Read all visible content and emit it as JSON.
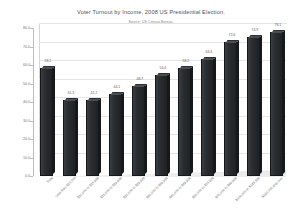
{
  "chart_data": {
    "type": "bar",
    "title": "Voter Turnout by Income, 2008 US Presidential Election.",
    "subtitle": "Source: US Census Bureau.",
    "xlabel": "",
    "ylabel": "",
    "ylim": [
      0.0,
      80.0
    ],
    "grid": true,
    "legend": "none",
    "yticks": [
      "0.0",
      "10.0",
      "20.0",
      "30.0",
      "40.0",
      "50.0",
      "60.0",
      "70.0",
      "80.0"
    ],
    "ytick_values": [
      0.0,
      10.0,
      20.0,
      30.0,
      40.0,
      50.0,
      60.0,
      70.0,
      80.0
    ],
    "categories": [
      "Total",
      "Less than $10,000",
      "$10,000 to $14,999",
      "$15,000 to $19,999",
      "$20,000 to $29,999",
      "$30,000 to $39,999",
      "$40,000 to $49,999",
      "$50,000 to $74,999",
      "$75,000 to $99,999",
      "$100,000 to $149,999",
      "$150,000 and over"
    ],
    "values": [
      58.2,
      41.3,
      41.2,
      44.1,
      48.7,
      54.4,
      58.2,
      63.4,
      72.6,
      74.9,
      78.1
    ],
    "value_labels": [
      "58.2",
      "41.3",
      "41.2",
      "44.1",
      "48.7",
      "54.4",
      "58.2",
      "63.4",
      "72.6",
      "74.9",
      "78.1"
    ],
    "bar_color": "#262A2D",
    "bar_top_color": "#4A4E52",
    "bar_side_color": "#16181A",
    "grid_color": "#E3E6E8",
    "axis_color": "#B9BDC1",
    "text_color": "#6D7276",
    "background": "#FFFFFF"
  }
}
